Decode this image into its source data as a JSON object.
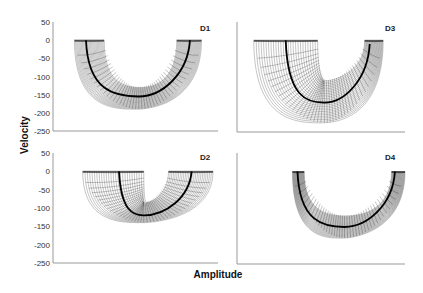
{
  "figure": {
    "y_axis_title": "Velocity",
    "x_axis_title": "Amplitude"
  },
  "chart_data": [
    {
      "type": "line",
      "panel": "D1",
      "title": "D1",
      "xlabel": "Amplitude",
      "ylabel": "Velocity",
      "ylim": [
        -250,
        50
      ],
      "yticks": [
        50,
        0,
        -50,
        -100,
        -150,
        -200,
        -250
      ],
      "grid": false,
      "description": "U-shaped mesh band; thick mean trajectory",
      "mean_curve": {
        "start": [
          0.2,
          0
        ],
        "min": [
          0.52,
          -155
        ],
        "end": [
          0.83,
          0
        ]
      },
      "band_outer_min": -190,
      "band_inner_min": -130,
      "band_top_left": [
        0.13,
        0.31
      ],
      "band_top_right": [
        0.75,
        0.9
      ]
    },
    {
      "type": "line",
      "panel": "D3",
      "title": "D3",
      "xlabel": "Amplitude",
      "ylabel": "Velocity",
      "ylim": [
        -250,
        50
      ],
      "yticks": [
        50,
        0,
        -50,
        -100,
        -150,
        -200,
        -250
      ],
      "grid": false,
      "description": "Asymmetric V-shaped mesh band; thick mean trajectory",
      "mean_curve": {
        "start": [
          0.29,
          0
        ],
        "min": [
          0.52,
          -170
        ],
        "end": [
          0.79,
          -10
        ]
      },
      "band_outer_min": -225,
      "band_inner_min": -110,
      "band_top_left": [
        0.1,
        0.48
      ],
      "band_top_right": [
        0.76,
        0.87
      ]
    },
    {
      "type": "line",
      "panel": "D2",
      "title": "D2",
      "xlabel": "Amplitude",
      "ylabel": "Velocity",
      "ylim": [
        -250,
        50
      ],
      "yticks": [
        50,
        0,
        -50,
        -100,
        -150,
        -200,
        -250
      ],
      "grid": false,
      "description": "Shallow U-shaped mesh band, dark top; thick mean trajectory",
      "mean_curve": {
        "start": [
          0.4,
          0
        ],
        "min": [
          0.55,
          -120
        ],
        "end": [
          0.84,
          0
        ]
      },
      "band_outer_min": -140,
      "band_inner_min": -85,
      "band_top_left": [
        0.18,
        0.55
      ],
      "band_top_right": [
        0.7,
        0.97
      ]
    },
    {
      "type": "line",
      "panel": "D4",
      "title": "D4",
      "xlabel": "Amplitude",
      "ylabel": "Velocity",
      "ylim": [
        -250,
        50
      ],
      "yticks": [
        50,
        0,
        -50,
        -100,
        -150,
        -200,
        -250
      ],
      "grid": false,
      "description": "Narrow symmetric U-shaped mesh band; thick mean trajectory",
      "mean_curve": {
        "start": [
          0.36,
          0
        ],
        "min": [
          0.64,
          -150
        ],
        "end": [
          0.94,
          0
        ]
      },
      "band_outer_min": -180,
      "band_inner_min": -120,
      "band_top_left": [
        0.33,
        0.4
      ],
      "band_top_right": [
        0.92,
        1.0
      ]
    }
  ]
}
